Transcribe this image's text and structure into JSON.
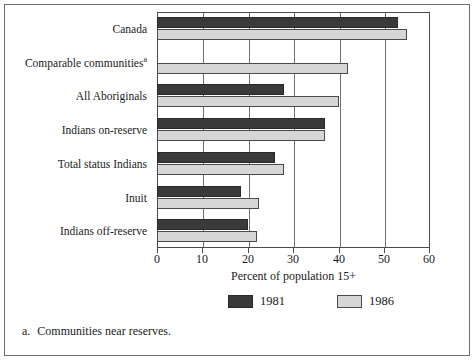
{
  "chart_data": {
    "type": "bar",
    "orientation": "horizontal",
    "title": "",
    "xlabel": "Percent of population 15+",
    "ylabel": "",
    "xlim": [
      0,
      60
    ],
    "xticks": [
      0,
      10,
      20,
      30,
      40,
      50,
      60
    ],
    "xticklabels": [
      "0",
      "10",
      "20",
      "30",
      "40",
      "50",
      "60"
    ],
    "grid": true,
    "legend_position": "bottom",
    "categories": [
      "Canada",
      "Comparable communitiesᵃ",
      "All Aboriginals",
      "Indians on-reserve",
      "Total status Indians",
      "Inuit",
      "Indians off-reserve"
    ],
    "category_labels": [
      {
        "text": "Canada",
        "footnote": ""
      },
      {
        "text": "Comparable communities",
        "footnote": "a"
      },
      {
        "text": "All Aboriginals",
        "footnote": ""
      },
      {
        "text": "Indians on-reserve",
        "footnote": ""
      },
      {
        "text": "Total status Indians",
        "footnote": ""
      },
      {
        "text": "Inuit",
        "footnote": ""
      },
      {
        "text": "Indians off-reserve",
        "footnote": ""
      }
    ],
    "series": [
      {
        "name": "1981",
        "color": "#3a3a3a",
        "values": [
          53,
          null,
          28,
          37,
          26,
          18.5,
          20
        ]
      },
      {
        "name": "1986",
        "color": "#d6d6d6",
        "values": [
          55,
          42,
          40,
          37,
          28,
          22.5,
          22
        ]
      }
    ]
  },
  "legend": {
    "items": [
      {
        "label": "1981",
        "swatch": "s1981"
      },
      {
        "label": "1986",
        "swatch": "s1986"
      }
    ]
  },
  "footnote": {
    "marker": "a.",
    "text": "Communities near reserves."
  },
  "colors": {
    "series_1981": "#3a3a3a",
    "series_1986": "#d6d6d6",
    "axis": "#4a4a4a",
    "grid": "#6f6f6f",
    "frame": "#6d6d6d",
    "text": "#1a1a1a",
    "background": "#ffffff"
  }
}
